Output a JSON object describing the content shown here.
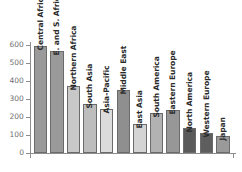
{
  "chart_data": {
    "type": "bar",
    "title": "",
    "subtitle": "",
    "xlabel": "",
    "ylabel": "",
    "ylim": [
      0,
      640
    ],
    "yticks": [
      0,
      100,
      200,
      300,
      400,
      500,
      600
    ],
    "ytick_labels": [
      "0",
      "100",
      "200",
      "300",
      "400",
      "500",
      "600"
    ],
    "grid": false,
    "legend": "none",
    "orientation": "vertical",
    "label_rotation": -90,
    "categories": [
      "Central Africa",
      "E. and S. Africa",
      "Northern Africa",
      "South Asia",
      "Asia-Pacific",
      "Middle East",
      "East Asia",
      "South America",
      "Eastern Europe",
      "North America",
      "Western Europe",
      "Japan"
    ],
    "values": [
      594,
      567,
      372,
      272,
      245,
      350,
      162,
      222,
      240,
      140,
      112,
      95
    ],
    "bar_colors": [
      "#9a9a9a",
      "#9a9a9a",
      "#c8c8c8",
      "#bdbdbd",
      "#dcdcdc",
      "#8f8f8f",
      "#d4d4d4",
      "#b2b2b2",
      "#979797",
      "#5a5a5a",
      "#5e5e5e",
      "#9a9a9a"
    ],
    "bar_edge_color": "#6b6b6b",
    "axis_color": "#8d8d8d",
    "tick_label_color": "#6f6f6f",
    "category_label_color": "#2b2b2b",
    "background_color": "#ffffff"
  }
}
